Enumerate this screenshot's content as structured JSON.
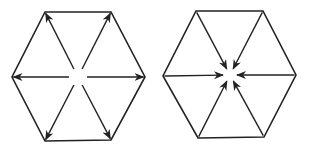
{
  "diagram": {
    "colors": {
      "stroke": "#222222",
      "background": "#ffffff"
    },
    "hexagons": [
      {
        "id": "outward",
        "arrow_direction": "outward",
        "center": [
          78,
          77
        ],
        "vertices": [
          [
            45,
            12
          ],
          [
            111,
            12
          ],
          [
            145,
            77
          ],
          [
            111,
            140
          ],
          [
            45,
            141
          ],
          [
            12,
            77
          ]
        ],
        "center_gap": 9
      },
      {
        "id": "inward",
        "arrow_direction": "inward",
        "center": [
          230,
          75
        ],
        "vertices": [
          [
            196,
            11
          ],
          [
            263,
            11
          ],
          [
            296,
            75
          ],
          [
            264,
            137
          ],
          [
            198,
            138
          ],
          [
            163,
            76
          ]
        ],
        "center_gap": 7
      }
    ]
  }
}
